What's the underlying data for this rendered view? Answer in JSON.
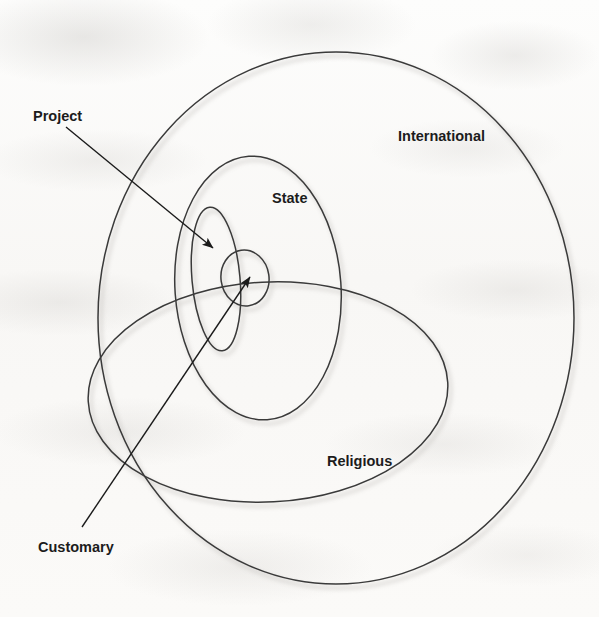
{
  "figure": {
    "kind": "nested-set-venn-diagram",
    "background_color": "#fbfbfa",
    "stroke_color": "#3a3a3a",
    "label_color": "#1c1c1c",
    "shadow_color": "#c9c6c2"
  },
  "labels": {
    "international": "International",
    "state": "State",
    "religious": "Religious",
    "project": "Project",
    "customary": "Customary"
  },
  "shapes": [
    {
      "name": "international",
      "label": "International",
      "type": "circle",
      "cx": 336,
      "cy": 318,
      "rx": 238,
      "ry": 266,
      "label_x": 398,
      "label_y": 141
    },
    {
      "name": "state",
      "label": "State",
      "type": "ellipse",
      "cx": 258,
      "cy": 288,
      "rx": 83,
      "ry": 132,
      "rotate": -4,
      "label_x": 272,
      "label_y": 203
    },
    {
      "name": "religious",
      "label": "Religious",
      "type": "ellipse",
      "cx": 268,
      "cy": 392,
      "rx": 180,
      "ry": 110,
      "rotate": -3,
      "label_x": 327,
      "label_y": 466
    },
    {
      "name": "project",
      "label": "Project",
      "type": "ellipse",
      "cx": 216,
      "cy": 279,
      "rx": 24,
      "ry": 72,
      "rotate": -5,
      "label_x": 33,
      "label_y": 121
    },
    {
      "name": "customary",
      "label": "Customary",
      "type": "ellipse",
      "cx": 245,
      "cy": 278,
      "rx": 24,
      "ry": 28,
      "rotate": -8,
      "label_x": 38,
      "label_y": 552
    }
  ],
  "leader_lines": [
    {
      "name": "project-leader",
      "from_label": "Project",
      "x1": 66,
      "y1": 127,
      "x2": 213,
      "y2": 248
    },
    {
      "name": "customary-leader",
      "from_label": "Customary",
      "x1": 82,
      "y1": 527,
      "x2": 250,
      "y2": 277
    }
  ]
}
